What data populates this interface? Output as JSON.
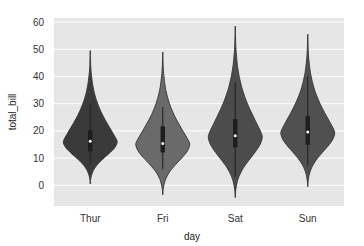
{
  "chart_data": {
    "type": "violin",
    "title": "",
    "xlabel": "day",
    "ylabel": "total_bill",
    "categories": [
      "Thur",
      "Fri",
      "Sat",
      "Sun"
    ],
    "yticks": [
      0,
      10,
      20,
      30,
      40,
      50,
      60
    ],
    "ylim": [
      -7.6,
      61.5
    ],
    "grid": true,
    "legend": null,
    "series": [
      {
        "name": "Thur",
        "min": 0.5,
        "max": 49.5,
        "q1": 12.5,
        "median": 16.2,
        "q3": 20.2,
        "whisker_low": 7.5,
        "whisker_high": 29.8,
        "color": "#3a3a3a"
      },
      {
        "name": "Fri",
        "min": -3.5,
        "max": 49.0,
        "q1": 12.1,
        "median": 15.4,
        "q3": 21.7,
        "whisker_low": 5.8,
        "whisker_high": 28.9,
        "color": "#6a6a6a"
      },
      {
        "name": "Sat",
        "min": -4.5,
        "max": 58.5,
        "q1": 13.9,
        "median": 18.2,
        "q3": 24.4,
        "whisker_low": 3.1,
        "whisker_high": 38.0,
        "color": "#4c4c4c"
      },
      {
        "name": "Sun",
        "min": -0.5,
        "max": 55.5,
        "q1": 14.9,
        "median": 19.6,
        "q3": 25.5,
        "whisker_low": 7.3,
        "whisker_high": 40.0,
        "color": "#505050"
      }
    ]
  },
  "colors": {
    "plot_background": "#e6e6e6",
    "gridline": "#ffffff",
    "figure_background": "#ffffff"
  }
}
